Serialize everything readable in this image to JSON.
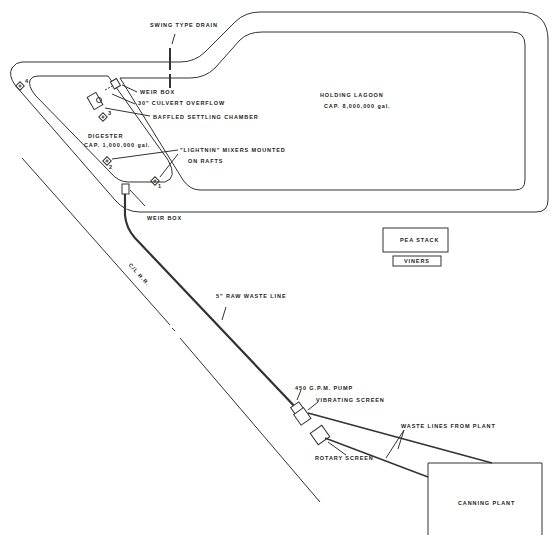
{
  "diagram": {
    "type": "site-plan",
    "colors": {
      "line": "#333333",
      "background": "#ffffff",
      "text": "#222222"
    },
    "labels": {
      "swing_drain": "SWING TYPE DRAIN",
      "weir_box_top": "WEIR BOX",
      "culvert": "30\" CULVERT OVERFLOW",
      "baffled": "BAFFLED SETTLING CHAMBER",
      "digester": "DIGESTER",
      "digester_cap": "CAP. 1,000,000 gal.",
      "mixers_1": "\"LIGHTNIN\" MIXERS MOUNTED",
      "mixers_2": "ON RAFTS",
      "weir_box_bottom": "WEIR BOX",
      "lagoon": "HOLDING LAGOON",
      "lagoon_cap": "CAP. 8,000,000 gal.",
      "pea_stack": "PEA STACK",
      "viners": "VINERS",
      "cl_rr": "C/L R.R.",
      "raw_waste": "5\" RAW WASTE LINE",
      "pump": "450 G.P.M. PUMP",
      "vibrating": "VIBRATING SCREEN",
      "waste_lines": "WASTE LINES FROM PLANT",
      "rotary": "ROTARY SCREEN",
      "canning": "CANNING PLANT"
    },
    "mixer_numbers": [
      "4",
      "3",
      "2",
      "1"
    ]
  }
}
